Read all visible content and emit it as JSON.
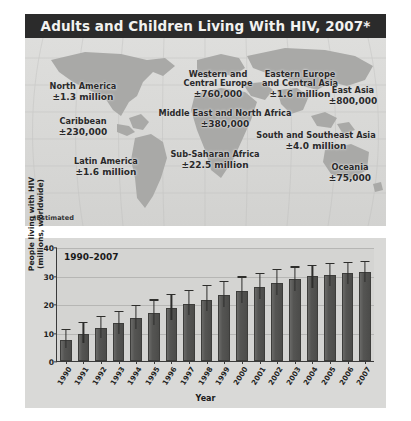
{
  "map": {
    "title": "Adults and Children Living With HIV, 2007*",
    "footnote": "*Estimated",
    "regions": [
      {
        "name": "North America",
        "value": "±1.3 million",
        "x": 58,
        "y": 44
      },
      {
        "name": "Western and\nCentral Europe",
        "value": "±760,000",
        "x": 194,
        "y": 22
      },
      {
        "name": "Eastern Europe\nand Central Asia",
        "value": "±1.6 million",
        "x": 272,
        "y": 22
      },
      {
        "name": "East Asia",
        "value": "±800,000",
        "x": 341,
        "y": 48
      },
      {
        "name": "Caribbean",
        "value": "±230,000",
        "x": 56,
        "y": 79
      },
      {
        "name": "Middle East and North Africa",
        "value": "±380,000",
        "x": 200,
        "y": 71
      },
      {
        "name": "South and Southeast Asia",
        "value": "±4.0 million",
        "x": 299,
        "y": 93
      },
      {
        "name": "Latin America",
        "value": "±1.6 million",
        "x": 81,
        "y": 119
      },
      {
        "name": "Sub-Saharan Africa",
        "value": "±22.5 million",
        "x": 190,
        "y": 112
      },
      {
        "name": "Oceania",
        "value": "±75,000",
        "x": 329,
        "y": 125
      }
    ]
  },
  "chart_data": {
    "type": "bar",
    "title": "1990–2007",
    "xlabel": "Year",
    "ylabel": "People living with HIV\n(millions, worldwide)",
    "ylim": [
      0,
      40
    ],
    "yticks": [
      0,
      10,
      20,
      30,
      40
    ],
    "grid": true,
    "legend": "none",
    "categories": [
      "1990",
      "1991",
      "1992",
      "1993",
      "1994",
      "1995",
      "1996",
      "1997",
      "1998",
      "1999",
      "2000",
      "2001",
      "2002",
      "2003",
      "2004",
      "2005",
      "2006",
      "2007"
    ],
    "values": [
      7.5,
      9.6,
      11.5,
      13.2,
      15.0,
      16.7,
      18.5,
      20.1,
      21.5,
      23.0,
      24.5,
      26.0,
      27.5,
      28.8,
      29.7,
      30.3,
      30.9,
      31.3
    ],
    "error_high": [
      10.9,
      13.2,
      15.4,
      17.2,
      19.2,
      21.2,
      23.0,
      24.6,
      26.2,
      27.8,
      29.3,
      30.6,
      31.8,
      32.8,
      33.4,
      33.9,
      34.4,
      34.8
    ],
    "error_low": [
      4.5,
      6.3,
      8.0,
      9.6,
      11.2,
      12.8,
      14.4,
      16.0,
      17.4,
      18.8,
      20.2,
      21.6,
      23.0,
      24.4,
      25.6,
      26.4,
      27.0,
      27.6
    ]
  },
  "colors": {
    "title_bar": "#2b2b2b",
    "panel_bg": "#d9d9d7",
    "bar_fill": "#55554f",
    "land": "#a8a8a6",
    "text": "#1e1e1e"
  }
}
